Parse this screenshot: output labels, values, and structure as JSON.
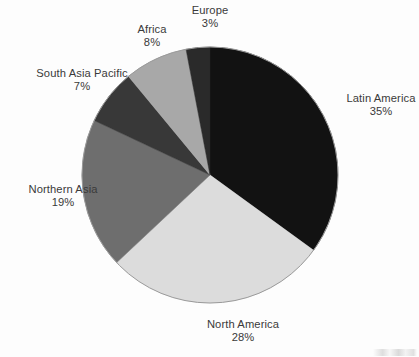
{
  "chart_data": {
    "type": "pie",
    "title": "",
    "subtitle": "",
    "xlabel": "",
    "ylabel": "",
    "legend_position": "none",
    "labels_position": "outside-radial",
    "grid": false,
    "value_suffix": "%",
    "total": 100,
    "categories": [
      "Latin America",
      "North America",
      "Northern Asia",
      "South Asia Pacific",
      "Africa",
      "Europe"
    ],
    "values": [
      35,
      28,
      19,
      7,
      8,
      3
    ],
    "slices": [
      {
        "name": "Latin America",
        "value": 35,
        "value_label": "35%",
        "color": "#121212",
        "start_angle": 0,
        "end_angle": 126,
        "label_side": "right"
      },
      {
        "name": "North America",
        "value": 28,
        "value_label": "28%",
        "color": "#dcdcdc",
        "start_angle": 126,
        "end_angle": 226.8,
        "label_side": "bottom"
      },
      {
        "name": "Northern Asia",
        "value": 19,
        "value_label": "19%",
        "color": "#6e6e6e",
        "start_angle": 226.8,
        "end_angle": 295.2,
        "label_side": "left"
      },
      {
        "name": "South Asia Pacific",
        "value": 7,
        "value_label": "7%",
        "color": "#383838",
        "start_angle": 295.2,
        "end_angle": 320.4,
        "label_side": "left"
      },
      {
        "name": "Africa",
        "value": 8,
        "value_label": "8%",
        "color": "#a8a8a8",
        "start_angle": 320.4,
        "end_angle": 349.2,
        "label_side": "top-left"
      },
      {
        "name": "Europe",
        "value": 3,
        "value_label": "3%",
        "color": "#2a2a2a",
        "start_angle": 349.2,
        "end_angle": 360,
        "label_side": "top"
      }
    ],
    "geometry": {
      "center_x": 210,
      "center_y": 175,
      "radius": 128,
      "outline_color": "#9a9a9a"
    },
    "background_color": "#fdfdfd",
    "label_text_color": "#3a3a3a"
  }
}
